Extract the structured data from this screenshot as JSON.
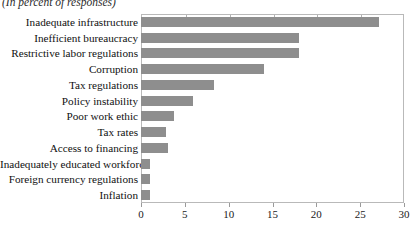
{
  "subtitle": "(In percent of responses)",
  "chart_data": {
    "type": "bar",
    "orientation": "horizontal",
    "title": "",
    "subtitle": "(In percent of responses)",
    "xlabel": "",
    "ylabel": "",
    "xlim": [
      0,
      30
    ],
    "xticks": [
      0,
      5,
      10,
      15,
      20,
      25,
      30
    ],
    "xtick_labels": [
      "0",
      "5",
      "10",
      "15",
      "20",
      "25",
      "30"
    ],
    "grid": false,
    "legend": false,
    "bar_color": "#8e8e8e",
    "frame_color": "#b9b9b9",
    "categories": [
      "Inadequate infrastructure",
      "Inefficient bureaucracy",
      "Restrictive labor regulations",
      "Corruption",
      "Tax regulations",
      "Policy instability",
      "Poor work ethic",
      "Tax rates",
      "Access to financing",
      "Inadequately educated workforce",
      "Foreign currency regulations",
      "Inflation"
    ],
    "values": [
      27.1,
      18.0,
      18.0,
      14.0,
      8.3,
      5.9,
      3.8,
      2.8,
      3.1,
      1.0,
      1.0,
      1.0
    ]
  }
}
